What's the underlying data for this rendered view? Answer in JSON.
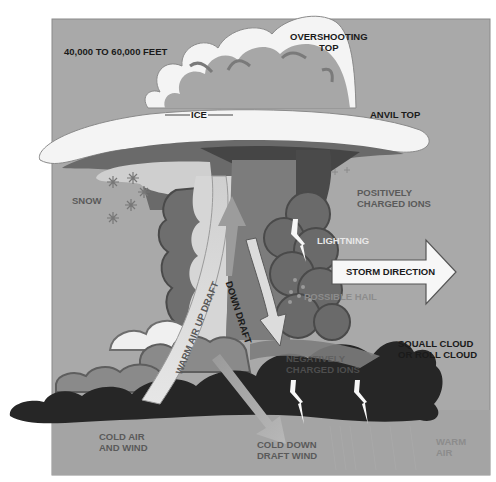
{
  "diagram": {
    "colors": {
      "sky": "#a9a9a9",
      "cloud_white": "#f4f4f4",
      "cloud_light": "#d4d4d4",
      "cloud_mid": "#8a8a8a",
      "cloud_dark": "#5e5e5e",
      "cloud_darker": "#4a4a4a",
      "squall_black": "#262626",
      "ground": "#a6a6a6"
    },
    "labels": {
      "altitude": "40,000 TO 60,000 FEET",
      "overshooting_top": [
        "OVERSHOOTING",
        "TOP"
      ],
      "ice": "ICE",
      "anvil_top": "ANVIL TOP",
      "snow": "SNOW",
      "positively_charged": [
        "POSITIVELY",
        "CHARGED IONS"
      ],
      "lightning": "LIGHTNING",
      "storm_direction": "STORM DIRECTION",
      "possible_hail": "POSSIBLE HAIL",
      "down_draft": "DOWN DRAFT",
      "warm_air_up_draft": "WARM AIR UP DRAFT",
      "squall_cloud": [
        "SQUALL CLOUD",
        "OR ROLL CLOUD"
      ],
      "negatively_charged": [
        "NEGATIVELY",
        "CHARGED IONS"
      ],
      "cold_air_wind": [
        "COLD AIR",
        "AND WIND"
      ],
      "cold_down_draft": [
        "COLD DOWN",
        "DRAFT WIND"
      ],
      "warm_air": [
        "WARM",
        "AIR"
      ]
    },
    "icons": {
      "snowflake": "snowflake-icon",
      "lightning": "lightning-bolt-icon",
      "arrow": "arrow-icon"
    }
  }
}
